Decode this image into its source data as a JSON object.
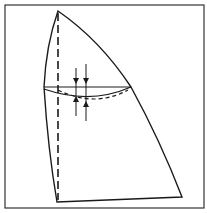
{
  "figure": {
    "colors": {
      "line": "#1a1a1a",
      "background": "#ffffff",
      "frame": "#333333"
    },
    "labels": []
  }
}
